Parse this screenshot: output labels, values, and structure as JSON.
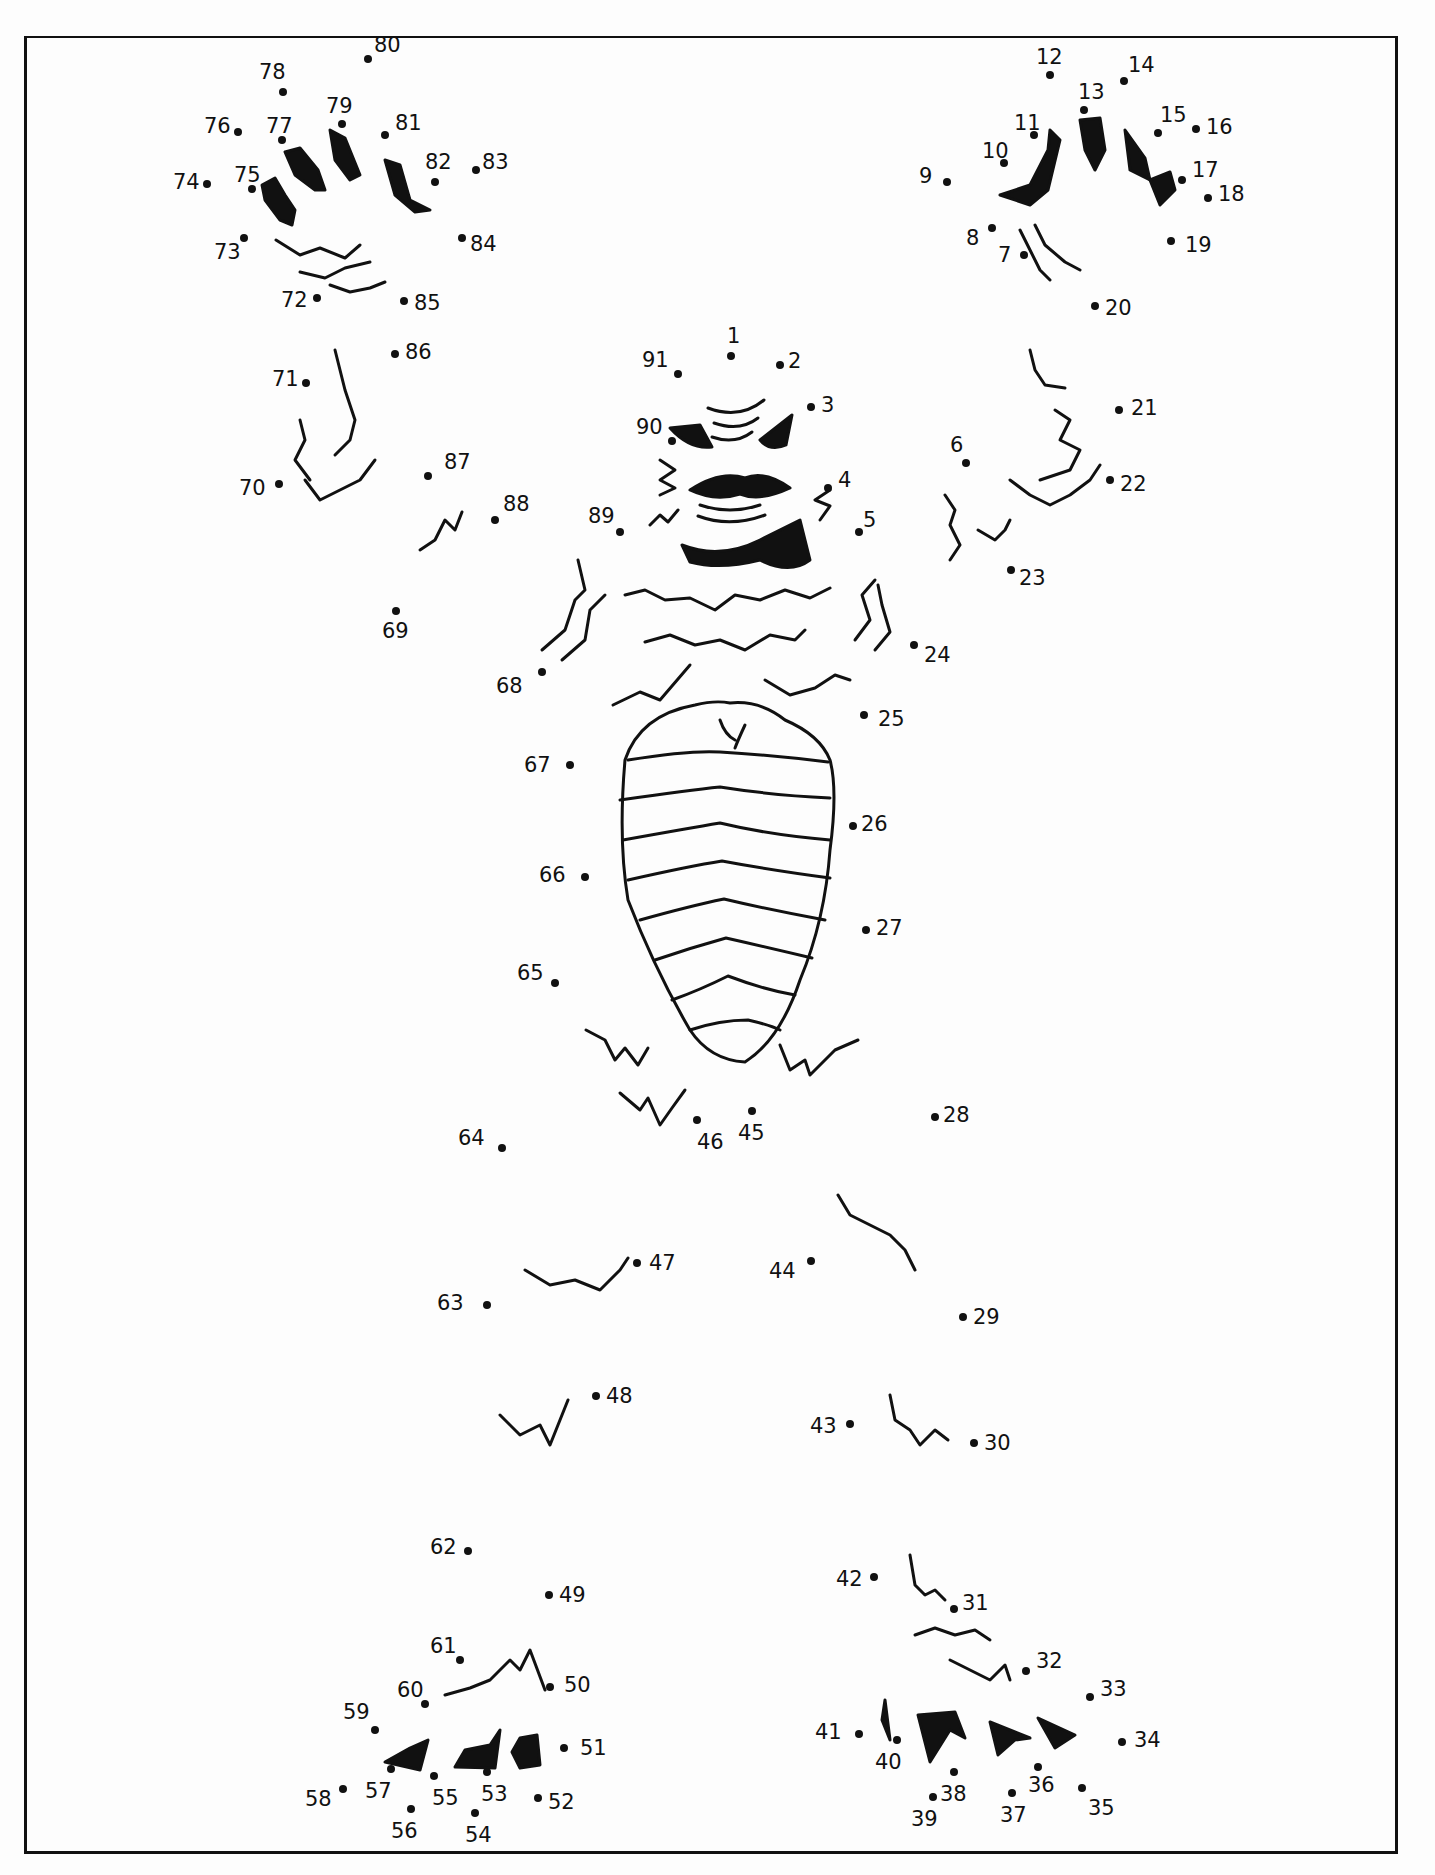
{
  "worksheet": {
    "type": "connect-the-dots",
    "subject": "creature figure",
    "total_dots": 91,
    "page_number_partial": "...",
    "ink_color": "#111111",
    "paper_color": "#fdfdfd"
  },
  "dots": [
    {
      "n": "1",
      "x": 731,
      "y": 356,
      "lx": -4,
      "ly": -30
    },
    {
      "n": "2",
      "x": 780,
      "y": 365,
      "lx": 8,
      "ly": -14
    },
    {
      "n": "3",
      "x": 811,
      "y": 407,
      "lx": 10,
      "ly": -12
    },
    {
      "n": "4",
      "x": 828,
      "y": 488,
      "lx": 10,
      "ly": -18
    },
    {
      "n": "5",
      "x": 859,
      "y": 532,
      "lx": 4,
      "ly": -22
    },
    {
      "n": "6",
      "x": 966,
      "y": 463,
      "lx": -16,
      "ly": -28
    },
    {
      "n": "7",
      "x": 1024,
      "y": 255,
      "lx": -26,
      "ly": -10
    },
    {
      "n": "8",
      "x": 992,
      "y": 228,
      "lx": -26,
      "ly": 0
    },
    {
      "n": "9",
      "x": 947,
      "y": 182,
      "lx": -28,
      "ly": -16
    },
    {
      "n": "10",
      "x": 1004,
      "y": 163,
      "lx": -22,
      "ly": -22
    },
    {
      "n": "11",
      "x": 1034,
      "y": 135,
      "lx": -20,
      "ly": -22
    },
    {
      "n": "12",
      "x": 1050,
      "y": 75,
      "lx": -14,
      "ly": -28
    },
    {
      "n": "13",
      "x": 1084,
      "y": 110,
      "lx": -6,
      "ly": -28
    },
    {
      "n": "14",
      "x": 1124,
      "y": 81,
      "lx": 4,
      "ly": -26
    },
    {
      "n": "15",
      "x": 1158,
      "y": 133,
      "lx": 2,
      "ly": -28
    },
    {
      "n": "16",
      "x": 1196,
      "y": 129,
      "lx": 10,
      "ly": -12
    },
    {
      "n": "17",
      "x": 1182,
      "y": 180,
      "lx": 10,
      "ly": -20
    },
    {
      "n": "18",
      "x": 1208,
      "y": 198,
      "lx": 10,
      "ly": -14
    },
    {
      "n": "19",
      "x": 1171,
      "y": 241,
      "lx": 14,
      "ly": -6
    },
    {
      "n": "20",
      "x": 1095,
      "y": 306,
      "lx": 10,
      "ly": -8
    },
    {
      "n": "21",
      "x": 1119,
      "y": 410,
      "lx": 12,
      "ly": -12
    },
    {
      "n": "22",
      "x": 1110,
      "y": 480,
      "lx": 10,
      "ly": -6
    },
    {
      "n": "23",
      "x": 1011,
      "y": 570,
      "lx": 8,
      "ly": -2
    },
    {
      "n": "24",
      "x": 914,
      "y": 645,
      "lx": 10,
      "ly": 0
    },
    {
      "n": "25",
      "x": 864,
      "y": 715,
      "lx": 14,
      "ly": -6
    },
    {
      "n": "26",
      "x": 853,
      "y": 826,
      "lx": 8,
      "ly": -12
    },
    {
      "n": "27",
      "x": 866,
      "y": 930,
      "lx": 10,
      "ly": -12
    },
    {
      "n": "28",
      "x": 935,
      "y": 1117,
      "lx": 8,
      "ly": -12
    },
    {
      "n": "29",
      "x": 963,
      "y": 1317,
      "lx": 10,
      "ly": -10
    },
    {
      "n": "30",
      "x": 974,
      "y": 1443,
      "lx": 10,
      "ly": -10
    },
    {
      "n": "31",
      "x": 954,
      "y": 1609,
      "lx": 8,
      "ly": -16
    },
    {
      "n": "32",
      "x": 1026,
      "y": 1671,
      "lx": 10,
      "ly": -20
    },
    {
      "n": "33",
      "x": 1090,
      "y": 1697,
      "lx": 10,
      "ly": -18
    },
    {
      "n": "34",
      "x": 1122,
      "y": 1742,
      "lx": 12,
      "ly": -12
    },
    {
      "n": "35",
      "x": 1082,
      "y": 1788,
      "lx": 6,
      "ly": 10
    },
    {
      "n": "36",
      "x": 1038,
      "y": 1767,
      "lx": -10,
      "ly": 8
    },
    {
      "n": "37",
      "x": 1012,
      "y": 1793,
      "lx": -12,
      "ly": 12
    },
    {
      "n": "38",
      "x": 954,
      "y": 1772,
      "lx": -14,
      "ly": 12
    },
    {
      "n": "39",
      "x": 933,
      "y": 1797,
      "lx": -22,
      "ly": 12
    },
    {
      "n": "40",
      "x": 897,
      "y": 1740,
      "lx": -22,
      "ly": 12
    },
    {
      "n": "41",
      "x": 859,
      "y": 1734,
      "lx": -44,
      "ly": -12
    },
    {
      "n": "42",
      "x": 874,
      "y": 1577,
      "lx": -38,
      "ly": -8
    },
    {
      "n": "43",
      "x": 850,
      "y": 1424,
      "lx": -40,
      "ly": -8
    },
    {
      "n": "44",
      "x": 811,
      "y": 1261,
      "lx": -42,
      "ly": 0
    },
    {
      "n": "45",
      "x": 752,
      "y": 1111,
      "lx": -14,
      "ly": 12
    },
    {
      "n": "46",
      "x": 697,
      "y": 1120,
      "lx": 0,
      "ly": 12
    },
    {
      "n": "47",
      "x": 637,
      "y": 1263,
      "lx": 12,
      "ly": -10
    },
    {
      "n": "48",
      "x": 596,
      "y": 1396,
      "lx": 10,
      "ly": -10
    },
    {
      "n": "49",
      "x": 549,
      "y": 1595,
      "lx": 10,
      "ly": -10
    },
    {
      "n": "50",
      "x": 550,
      "y": 1687,
      "lx": 14,
      "ly": -12
    },
    {
      "n": "51",
      "x": 564,
      "y": 1748,
      "lx": 16,
      "ly": -10
    },
    {
      "n": "52",
      "x": 538,
      "y": 1798,
      "lx": 10,
      "ly": -6
    },
    {
      "n": "53",
      "x": 487,
      "y": 1772,
      "lx": -6,
      "ly": 12
    },
    {
      "n": "54",
      "x": 475,
      "y": 1813,
      "lx": -10,
      "ly": 12
    },
    {
      "n": "55",
      "x": 434,
      "y": 1776,
      "lx": -2,
      "ly": 12
    },
    {
      "n": "56",
      "x": 411,
      "y": 1809,
      "lx": -20,
      "ly": 12
    },
    {
      "n": "57",
      "x": 391,
      "y": 1769,
      "lx": -26,
      "ly": 12
    },
    {
      "n": "58",
      "x": 343,
      "y": 1789,
      "lx": -38,
      "ly": 0
    },
    {
      "n": "59",
      "x": 375,
      "y": 1730,
      "lx": -32,
      "ly": -28
    },
    {
      "n": "60",
      "x": 425,
      "y": 1704,
      "lx": -28,
      "ly": -24
    },
    {
      "n": "61",
      "x": 460,
      "y": 1660,
      "lx": -30,
      "ly": -24
    },
    {
      "n": "62",
      "x": 468,
      "y": 1551,
      "lx": -38,
      "ly": -14
    },
    {
      "n": "63",
      "x": 487,
      "y": 1305,
      "lx": -50,
      "ly": -12
    },
    {
      "n": "64",
      "x": 502,
      "y": 1148,
      "lx": -44,
      "ly": -20
    },
    {
      "n": "65",
      "x": 555,
      "y": 983,
      "lx": -38,
      "ly": -20
    },
    {
      "n": "66",
      "x": 585,
      "y": 877,
      "lx": -46,
      "ly": -12
    },
    {
      "n": "67",
      "x": 570,
      "y": 765,
      "lx": -46,
      "ly": -10
    },
    {
      "n": "68",
      "x": 542,
      "y": 672,
      "lx": -46,
      "ly": 4
    },
    {
      "n": "69",
      "x": 396,
      "y": 611,
      "lx": -14,
      "ly": 10
    },
    {
      "n": "70",
      "x": 279,
      "y": 484,
      "lx": -40,
      "ly": -6
    },
    {
      "n": "71",
      "x": 306,
      "y": 383,
      "lx": -34,
      "ly": -14
    },
    {
      "n": "72",
      "x": 317,
      "y": 298,
      "lx": -36,
      "ly": -8
    },
    {
      "n": "73",
      "x": 244,
      "y": 238,
      "lx": -30,
      "ly": 4
    },
    {
      "n": "74",
      "x": 207,
      "y": 184,
      "lx": -34,
      "ly": -12
    },
    {
      "n": "75",
      "x": 252,
      "y": 189,
      "lx": -18,
      "ly": -24
    },
    {
      "n": "76",
      "x": 238,
      "y": 132,
      "lx": -34,
      "ly": -16
    },
    {
      "n": "77",
      "x": 282,
      "y": 140,
      "lx": -16,
      "ly": -24
    },
    {
      "n": "78",
      "x": 283,
      "y": 92,
      "lx": -24,
      "ly": -30
    },
    {
      "n": "79",
      "x": 342,
      "y": 124,
      "lx": -16,
      "ly": -28
    },
    {
      "n": "80",
      "x": 368,
      "y": 59,
      "lx": 6,
      "ly": -24
    },
    {
      "n": "81",
      "x": 385,
      "y": 135,
      "lx": 10,
      "ly": -22
    },
    {
      "n": "82",
      "x": 435,
      "y": 182,
      "lx": -10,
      "ly": -30
    },
    {
      "n": "83",
      "x": 476,
      "y": 170,
      "lx": 6,
      "ly": -18
    },
    {
      "n": "84",
      "x": 462,
      "y": 238,
      "lx": 8,
      "ly": -4
    },
    {
      "n": "85",
      "x": 404,
      "y": 301,
      "lx": 10,
      "ly": -8
    },
    {
      "n": "86",
      "x": 395,
      "y": 354,
      "lx": 10,
      "ly": -12
    },
    {
      "n": "87",
      "x": 428,
      "y": 476,
      "lx": 16,
      "ly": -24
    },
    {
      "n": "88",
      "x": 495,
      "y": 520,
      "lx": 8,
      "ly": -26
    },
    {
      "n": "89",
      "x": 620,
      "y": 532,
      "lx": -32,
      "ly": -26
    },
    {
      "n": "90",
      "x": 672,
      "y": 441,
      "lx": -36,
      "ly": -24
    },
    {
      "n": "91",
      "x": 678,
      "y": 374,
      "lx": -36,
      "ly": -24
    }
  ]
}
